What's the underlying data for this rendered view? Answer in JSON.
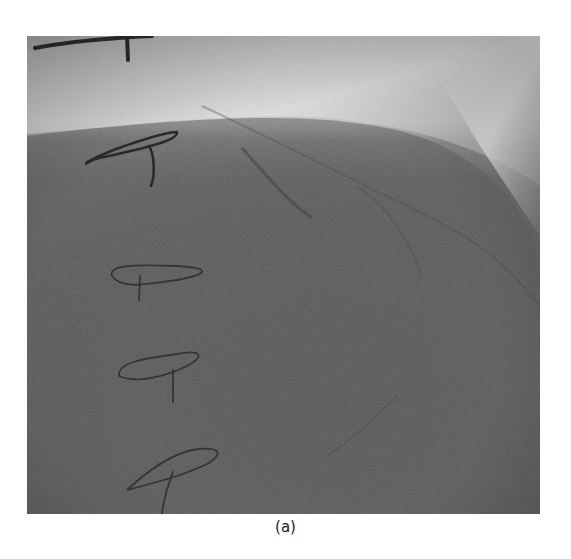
{
  "figure": {
    "caption": "(a)",
    "image_description": "Grayscale coronary angiography (fluoroscopy) frame with hand-drawn pen markings along the left side",
    "colors": {
      "background": "#ffffff",
      "bright_region": "#d8d8d8",
      "dark_region": "#555555",
      "pen_marks": "#1e1e1e"
    },
    "markings": [
      {
        "id": "top-bar-mark",
        "shape": "T-bar"
      },
      {
        "id": "mark-1",
        "shape": "loop-with-tail"
      },
      {
        "id": "mark-2",
        "shape": "loop-with-tail"
      },
      {
        "id": "mark-3",
        "shape": "loop-with-tail"
      },
      {
        "id": "mark-4",
        "shape": "loop-with-tail"
      }
    ]
  }
}
